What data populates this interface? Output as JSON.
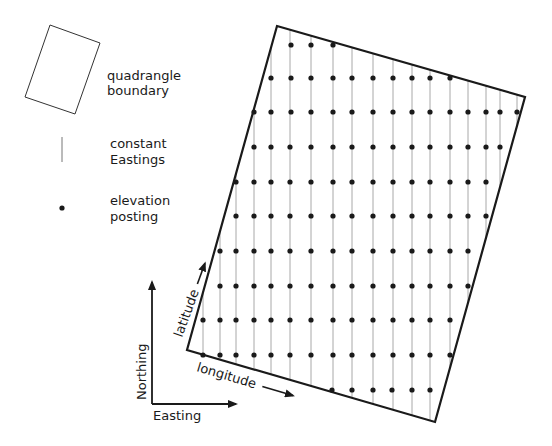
{
  "colors": {
    "background": "#ffffff",
    "boundary": "#1a1a1a",
    "easting_line": "#a8a8a8",
    "posting_dot": "#1a1a1a",
    "text": "#1a1a1a"
  },
  "legend": {
    "quadrangle": {
      "label_line1": "quadrangle",
      "label_line2": "boundary",
      "polygon": [
        [
          50,
          25
        ],
        [
          100,
          43
        ],
        [
          75,
          114
        ],
        [
          25,
          97
        ]
      ]
    },
    "easting_line": {
      "label_line1": "constant",
      "label_line2": "Eastings",
      "x": 62,
      "y1": 137,
      "y2": 162
    },
    "posting": {
      "label_line1": "elevation",
      "label_line2": "posting",
      "cx": 62,
      "cy": 208
    }
  },
  "axes": {
    "northing_label": "Northing",
    "easting_label": "Easting",
    "origin": [
      152,
      404
    ],
    "north_end": [
      152,
      282
    ],
    "east_end": [
      236,
      404
    ]
  },
  "quadrangle": {
    "corners": [
      [
        277,
        26
      ],
      [
        525,
        97
      ],
      [
        435,
        422
      ],
      [
        187,
        350
      ]
    ],
    "latitude_label": "latitude",
    "longitude_label": "longitude"
  },
  "grid": {
    "columns": [
      203,
      220,
      236,
      254,
      271,
      290,
      311,
      333,
      352,
      373,
      393,
      412,
      430,
      450,
      468,
      486,
      500,
      517
    ],
    "rows": [
      {
        "y": 45,
        "dots": [
          291,
          311,
          333
        ]
      },
      {
        "y": 78,
        "dots": [
          271,
          291,
          311,
          333,
          352,
          373,
          393,
          412,
          430,
          450
        ]
      },
      {
        "y": 112,
        "dots": [
          254,
          271,
          291,
          311,
          333,
          352,
          373,
          393,
          412,
          430,
          450,
          468,
          486,
          500,
          517
        ]
      },
      {
        "y": 147,
        "dots": [
          254,
          271,
          290,
          311,
          333,
          352,
          373,
          393,
          412,
          430,
          450,
          468,
          486,
          500
        ]
      },
      {
        "y": 182,
        "dots": [
          236,
          254,
          271,
          290,
          311,
          333,
          352,
          373,
          393,
          412,
          430,
          450,
          468,
          486
        ]
      },
      {
        "y": 216,
        "dots": [
          236,
          254,
          271,
          290,
          311,
          333,
          352,
          373,
          393,
          412,
          430,
          450,
          468,
          486
        ]
      },
      {
        "y": 251,
        "dots": [
          220,
          236,
          254,
          271,
          290,
          311,
          333,
          352,
          373,
          393,
          412,
          430,
          450,
          468
        ]
      },
      {
        "y": 286,
        "dots": [
          220,
          236,
          254,
          271,
          290,
          311,
          333,
          352,
          373,
          393,
          412,
          430,
          450,
          468
        ]
      },
      {
        "y": 320,
        "dots": [
          203,
          220,
          236,
          254,
          271,
          290,
          311,
          333,
          352,
          373,
          393,
          412,
          430,
          450
        ]
      },
      {
        "y": 355,
        "dots": [
          203,
          220,
          236,
          254,
          271,
          290,
          311,
          333,
          352,
          373,
          393,
          412,
          430,
          450
        ]
      },
      {
        "y": 390,
        "dots": [
          332,
          352,
          373,
          392,
          412,
          430
        ]
      }
    ]
  }
}
